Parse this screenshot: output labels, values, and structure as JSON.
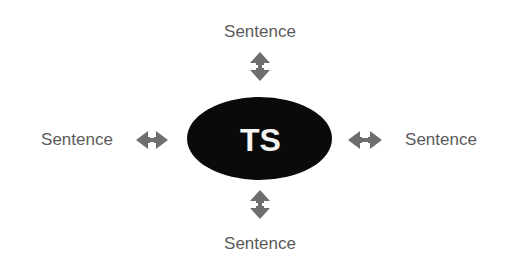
{
  "diagram": {
    "center": {
      "label": "TS",
      "fill": "#0a0a0a",
      "text_color": "#f4f4f4"
    },
    "nodes": [
      {
        "position": "top",
        "label": "Sentence"
      },
      {
        "position": "left",
        "label": "Sentence"
      },
      {
        "position": "right",
        "label": "Sentence"
      },
      {
        "position": "bottom",
        "label": "Sentence"
      }
    ],
    "connectors": [
      {
        "position": "top",
        "type": "double-arrow-vertical"
      },
      {
        "position": "left",
        "type": "double-arrow-horizontal"
      },
      {
        "position": "right",
        "type": "double-arrow-horizontal"
      },
      {
        "position": "bottom",
        "type": "double-arrow-vertical"
      }
    ],
    "colors": {
      "arrow": "#6e6e6e",
      "label_text": "#5a5a5a",
      "background": "#ffffff"
    }
  }
}
